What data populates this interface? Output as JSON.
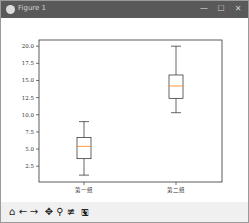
{
  "window": {
    "title": "Figure 1",
    "controls": {
      "minimize": "—",
      "maximize": "☐",
      "close": "✕"
    }
  },
  "toolbar": {
    "buttons": [
      {
        "name": "home",
        "glyph": "⌂"
      },
      {
        "name": "back",
        "glyph": "←"
      },
      {
        "name": "forward",
        "glyph": "→"
      },
      {
        "name": "pan",
        "glyph": "✥"
      },
      {
        "name": "zoom",
        "glyph": "⚲"
      },
      {
        "name": "configure",
        "glyph": "≢"
      },
      {
        "name": "save",
        "glyph": "🖫"
      }
    ]
  },
  "chart_data": {
    "type": "box",
    "title": "",
    "xlabel": "",
    "ylabel": "",
    "categories": [
      "第一组",
      "第二组"
    ],
    "boxes": [
      {
        "label": "第一组",
        "whisker_low": 1.2,
        "q1": 3.6,
        "median": 5.4,
        "q3": 6.7,
        "whisker_high": 9.0
      },
      {
        "label": "第二组",
        "whisker_low": 10.3,
        "q1": 12.4,
        "median": 14.2,
        "q3": 15.8,
        "whisker_high": 20.0
      }
    ],
    "yticks": [
      "2.5",
      "5.0",
      "7.5",
      "10.0",
      "12.5",
      "15.0",
      "17.5",
      "20.0"
    ],
    "ylim": [
      0.2,
      20.9
    ],
    "grid": false,
    "colors": {
      "box": "#000000",
      "median": "#ff7f0e"
    }
  }
}
